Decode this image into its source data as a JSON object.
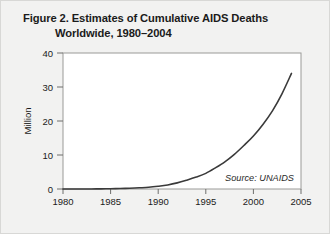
{
  "figure": {
    "title_line_1": "Figure 2. Estimates of Cumulative AIDS Deaths",
    "title_line_2": "Worldwide, 1980–2004",
    "source_note": "Source: UNAIDS",
    "background_color": "#f2f2f1",
    "plot_background_color": "#ffffff",
    "line_color": "#3a3a3a",
    "axis_color": "#8a8a88"
  },
  "chart_data": {
    "type": "line",
    "title": "Figure 2. Estimates of Cumulative AIDS Deaths Worldwide, 1980–2004",
    "xlabel": "",
    "ylabel": "Million",
    "xlim": [
      1980,
      2005
    ],
    "ylim": [
      0,
      40
    ],
    "grid": false,
    "legend": "none",
    "annotations": [
      "Source: UNAIDS"
    ],
    "xticks": [
      1980,
      1985,
      1990,
      1995,
      2000,
      2005
    ],
    "xtick_labels": [
      "1980",
      "1985",
      "1990",
      "1995",
      "2000",
      "2005"
    ],
    "yticks": [
      0,
      10,
      20,
      30,
      40
    ],
    "ytick_labels": [
      "0",
      "10",
      "20",
      "30",
      "40"
    ],
    "series": [
      {
        "name": "Cumulative AIDS deaths worldwide",
        "x": [
          1980,
          1981,
          1982,
          1983,
          1984,
          1985,
          1986,
          1987,
          1988,
          1989,
          1990,
          1991,
          1992,
          1993,
          1994,
          1995,
          1996,
          1997,
          1998,
          1999,
          2000,
          2001,
          2002,
          2003,
          2004
        ],
        "values": [
          0.0,
          0.0,
          0.01,
          0.02,
          0.04,
          0.08,
          0.14,
          0.22,
          0.35,
          0.5,
          0.8,
          1.2,
          1.8,
          2.6,
          3.5,
          4.6,
          6.2,
          8.0,
          10.2,
          12.8,
          15.6,
          19.0,
          23.0,
          28.0,
          34.0
        ]
      }
    ]
  },
  "ytick_geometry": {
    "labels": [
      "40",
      "30",
      "20",
      "10",
      "0"
    ],
    "y_px": [
      52,
      86,
      120,
      154,
      188
    ]
  },
  "xtick_geometry": {
    "labels": [
      "1980",
      "1985",
      "1990",
      "1995",
      "2000",
      "2005"
    ],
    "x_px": [
      62,
      109.6,
      157.2,
      204.8,
      252.4,
      300
    ]
  }
}
